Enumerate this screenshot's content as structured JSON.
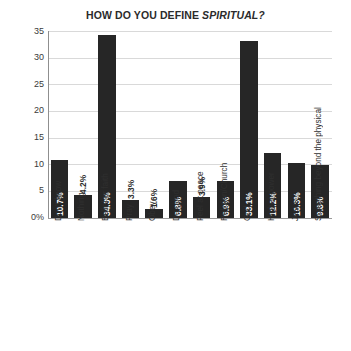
{
  "chart_data": {
    "type": "bar",
    "title": "HOW DO YOU DEFINE SPIRITUAL?",
    "title_plain": "HOW DO YOU DEFINE ",
    "title_italic": "SPIRITUAL?",
    "xlabel": "",
    "ylabel": "",
    "ylim": [
      0,
      35
    ],
    "grid": true,
    "legend": false,
    "orientation": "vertical",
    "bar_color": "#262626",
    "gridline_color": "#d9d9d9",
    "axis_color": "#8f8f8f",
    "background_color": "#ffffff",
    "ytick_labels": [
      "35",
      "30",
      "25",
      "20",
      "15",
      "10",
      "5",
      "0%"
    ],
    "ytick_values": [
      35,
      30,
      25,
      20,
      15,
      10,
      5,
      0
    ],
    "categories": [
      "Don't know",
      "Nothing",
      "Belief or faith",
      "Pray",
      "Obey",
      "Do good",
      "Feel at peace",
      "Religion/Church",
      "God",
      "Higher power",
      "Jesus",
      "Something beyond the physical"
    ],
    "values": [
      10.7,
      4.2,
      34.3,
      3.3,
      1.6,
      6.8,
      3.9,
      6.9,
      33.1,
      12.2,
      10.3,
      9.8
    ],
    "data_labels": [
      "10.7%",
      "4.2%",
      "34.3%",
      "3.3%",
      "1.6%",
      "6.8%",
      "3.9%",
      "6.9%",
      "33.1%",
      "12.2%",
      "10.3%",
      "9.8%"
    ],
    "label_placement": [
      "inside",
      "outside",
      "inside",
      "outside",
      "outside",
      "inside",
      "outside",
      "inside",
      "inside",
      "inside",
      "inside",
      "inside"
    ]
  }
}
